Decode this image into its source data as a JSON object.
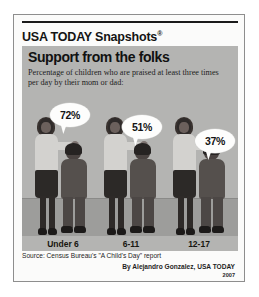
{
  "masthead": {
    "brand": "USA TODAY Snapshots",
    "registered_mark": "®"
  },
  "panel": {
    "title": "Support from the folks",
    "subtitle": "Percentage of children who are praised at least three times per day by their mom or dad:"
  },
  "chart_data": {
    "type": "bar",
    "title": "Support from the folks",
    "subtitle": "Percentage of children who are praised at least three times per day by their mom or dad:",
    "categories": [
      "Under 6",
      "6-11",
      "12-17"
    ],
    "values": [
      72,
      51,
      37
    ],
    "value_labels": [
      "72%",
      "51%",
      "37%"
    ],
    "xlabel": "",
    "ylabel": "Percentage of children",
    "ylim": [
      0,
      100
    ],
    "grid": false,
    "legend": false,
    "units": "percent",
    "pictogram": "adult-with-child figure per category"
  },
  "footer": {
    "source": "Source: Census Bureau's \"A Child's Day\" report",
    "byline": "By Alejandro Gonzalez, USA TODAY",
    "year": "2007"
  },
  "colors": {
    "panel_background": "#b4b4b2",
    "ground_band": "#9d9d9b",
    "bubble_fill": "#fdfdfc",
    "rule": "#1a1a1a",
    "card_border": "#8e8e8e",
    "adult_shirt": "#d3d2cf",
    "child_clothing": "#55504d"
  }
}
